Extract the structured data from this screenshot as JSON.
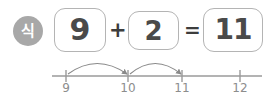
{
  "badge": {
    "label": "식",
    "color": "#a8a8a8",
    "text_color": "#ffffff",
    "name": "equation-badge"
  },
  "equation": {
    "expression": "9 + 2 = 11",
    "boxes": [
      {
        "value": "9",
        "name": "addend-1-box"
      },
      {
        "value": "2",
        "name": "addend-2-box"
      },
      {
        "value": "11",
        "name": "sum-box"
      }
    ],
    "operators": {
      "plus": "+",
      "equals": "="
    },
    "box_border_color": "#b4b4b4",
    "digit_color": "#4a4a4a"
  },
  "number_line": {
    "ticks": [
      {
        "label": "9",
        "x": 66
      },
      {
        "label": "10",
        "x": 128
      },
      {
        "label": "11",
        "x": 182
      },
      {
        "label": "12",
        "x": 240
      }
    ],
    "axis_start_x": 52,
    "axis_end_x": 262,
    "axis_y": 76,
    "line_color": "#9a9a9a",
    "label_color": "#8d8d8d",
    "hops": [
      {
        "from": "9",
        "to": "10",
        "from_x": 66,
        "to_x": 128
      },
      {
        "from": "10",
        "to": "11",
        "from_x": 128,
        "to_x": 182
      }
    ],
    "hop_color": "#8a8a8a"
  }
}
